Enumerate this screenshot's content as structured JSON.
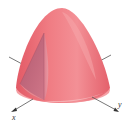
{
  "figure": {
    "colors": {
      "surface_light": "#f4a0a4",
      "surface_main": "#ec6d75",
      "surface_dark": "#d9505c",
      "wedge_face": "#c46a7c",
      "wedge_face_dark": "#a8566b",
      "base_rim": "#f7b8bb",
      "axis": "#555555"
    },
    "axes": {
      "x_label": "x",
      "y_label": "y"
    }
  }
}
